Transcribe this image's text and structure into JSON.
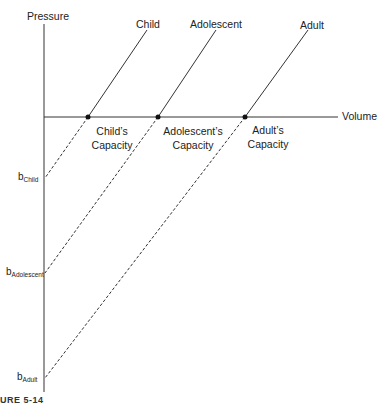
{
  "axes": {
    "y_label": "Pressure",
    "x_label": "Volume"
  },
  "curves": [
    {
      "name": "Child",
      "capacity_label_line1": "Child’s",
      "capacity_label_line2": "Capacity",
      "intercept_base": "b",
      "intercept_sub": "Child"
    },
    {
      "name": "Adolescent",
      "capacity_label_line1": "Adolescent’s",
      "capacity_label_line2": "Capacity",
      "intercept_base": "b",
      "intercept_sub": "Adolescent"
    },
    {
      "name": "Adult",
      "capacity_label_line1": "Adult’s",
      "capacity_label_line2": "Capacity",
      "intercept_base": "b",
      "intercept_sub": "Adult"
    }
  ],
  "caption": "URE 5-14",
  "colors": {
    "line": "#333333",
    "background": "#ffffff"
  }
}
